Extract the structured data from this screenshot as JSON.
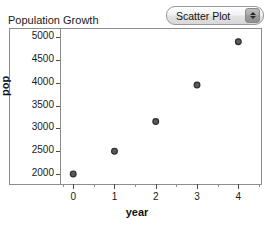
{
  "chart_title": "Population Growth",
  "controls": {
    "plot_type_label": "Scatter Plot",
    "stepper_up_icon": "triangle-up-icon",
    "stepper_down_icon": "triangle-down-icon"
  },
  "chart_data": {
    "type": "scatter",
    "title": "Population Growth",
    "xlabel": "year",
    "ylabel": "pop",
    "x": [
      0,
      1,
      2,
      3,
      4
    ],
    "values": [
      2000,
      2500,
      3150,
      3950,
      4900
    ],
    "points": [
      {
        "x": 0,
        "y": 2000
      },
      {
        "x": 1,
        "y": 2500
      },
      {
        "x": 2,
        "y": 3150
      },
      {
        "x": 3,
        "y": 3950
      },
      {
        "x": 4,
        "y": 4900
      }
    ],
    "xlim": [
      -0.32,
      4.55
    ],
    "ylim": [
      1780,
      5180
    ],
    "xticks": [
      0,
      1,
      2,
      3,
      4
    ],
    "xtick_labels": [
      "0",
      "1",
      "2",
      "3",
      "4"
    ],
    "x_minor_ticks": [
      -0.25,
      0.5,
      1.5,
      2.5,
      3.5,
      4.5
    ],
    "yticks": [
      2000,
      2500,
      3000,
      3500,
      4000,
      4500,
      5000
    ],
    "ytick_labels": [
      "2000",
      "2500",
      "3000",
      "3500",
      "4000",
      "4500",
      "5000"
    ],
    "grid": false,
    "legend": false,
    "marker_color": "#595959",
    "marker_edge_color": "#2b2b2b",
    "axis_color": "#8d8d8d"
  }
}
